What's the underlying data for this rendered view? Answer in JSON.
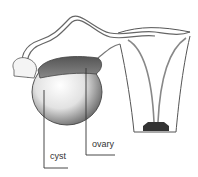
{
  "diagram": {
    "labels": [
      {
        "id": "cyst",
        "text": "cyst"
      },
      {
        "id": "ovary",
        "text": "ovary"
      }
    ],
    "colors": {
      "line": "#333333",
      "ovary_fill": "#6f6f6f",
      "cyst_fill": "#d8d8d8",
      "background": "#ffffff"
    }
  }
}
